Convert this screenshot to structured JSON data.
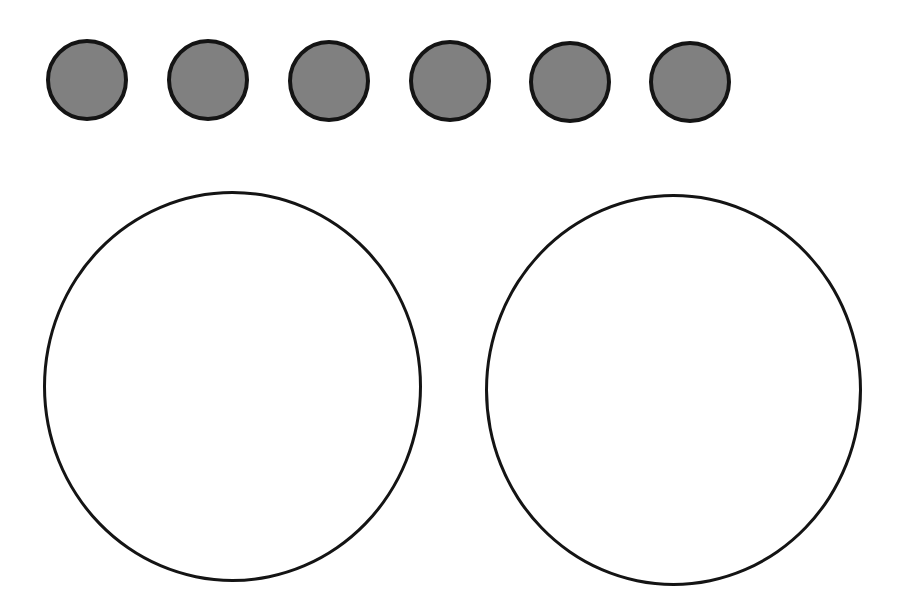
{
  "diagram": {
    "type": "counting-division-mat",
    "colors": {
      "background": "#ffffff",
      "token_fill": "#808080",
      "outline": "#141414"
    },
    "tokens": {
      "count": 6,
      "items": [
        {
          "cx": 87,
          "cy": 80,
          "r": 41
        },
        {
          "cx": 208,
          "cy": 80,
          "r": 41
        },
        {
          "cx": 329,
          "cy": 81,
          "r": 41
        },
        {
          "cx": 450,
          "cy": 81,
          "r": 41
        },
        {
          "cx": 570,
          "cy": 82,
          "r": 41
        },
        {
          "cx": 690,
          "cy": 82,
          "r": 41
        }
      ]
    },
    "groups": {
      "count": 2,
      "items": [
        {
          "cx": 232,
          "cy": 386,
          "r": 189
        },
        {
          "cx": 673,
          "cy": 390,
          "r": 188
        }
      ]
    }
  }
}
